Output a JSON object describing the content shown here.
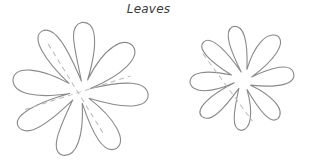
{
  "title": "Leaves",
  "diagram": {
    "shapes": [
      {
        "name": "large-eight-petal-flower",
        "petals": 8,
        "center": [
          80,
          91
        ],
        "fold_lines": 2
      },
      {
        "name": "small-eight-petal-flower",
        "petals": 8,
        "center": [
          242,
          80
        ],
        "fold_lines": 1
      }
    ],
    "colors": {
      "outline": "#8a8a8a",
      "fold_line": "#b9b9b9",
      "background": "#ffffff",
      "title": "#3a3a3a"
    }
  }
}
